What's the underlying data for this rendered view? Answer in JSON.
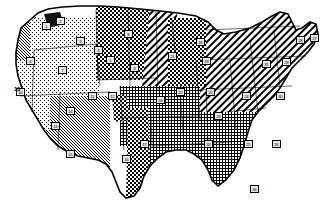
{
  "image": {
    "kind": "thematic-map",
    "subject": "Contiguous United States climate / region map",
    "style": "black-and-white halftone dithered print scan",
    "width": 332,
    "height": 215,
    "background_color": "#ffffff",
    "ink_color": "#000000"
  },
  "legend_patterns": [
    {
      "id": "stipple-light",
      "label": "light stipple",
      "description": "sparse dot stipple, very light tone"
    },
    {
      "id": "stipple-medium",
      "label": "medium stipple",
      "description": "medium dot stipple tone"
    },
    {
      "id": "grid-fine",
      "label": "fine crosshatch grid",
      "description": "fine square grid crosshatch"
    },
    {
      "id": "grid-heavy",
      "label": "heavy checkerboard",
      "description": "dense dark checkerboard blocks"
    },
    {
      "id": "diagonal-hatch",
      "label": "diagonal hatch",
      "description": "parallel diagonal lines"
    },
    {
      "id": "solid-dark",
      "label": "solid dark",
      "description": "near solid black fill"
    }
  ],
  "regions": [
    {
      "name": "pacific-northwest-coast",
      "pattern": "stipple-medium"
    },
    {
      "name": "great-basin-interior-west",
      "pattern": "stipple-light"
    },
    {
      "name": "northern-rockies-plains",
      "pattern": "grid-heavy"
    },
    {
      "name": "upper-midwest-hatch-band",
      "pattern": "diagonal-hatch"
    },
    {
      "name": "great-lakes",
      "pattern": "grid-heavy"
    },
    {
      "name": "northeast-new-england",
      "pattern": "diagonal-hatch"
    },
    {
      "name": "southeast-atlantic-gulf",
      "pattern": "grid-fine"
    },
    {
      "name": "texas-gulf-band",
      "pattern": "grid-heavy"
    },
    {
      "name": "southwest-desert",
      "pattern": "stipple-medium"
    },
    {
      "name": "california-central-valley",
      "pattern": "stipple-light"
    }
  ],
  "markers": [
    {
      "id": "m01",
      "label": "1",
      "x": 42,
      "y": 22
    },
    {
      "id": "m02",
      "label": "2",
      "x": 56,
      "y": 17
    },
    {
      "id": "m03",
      "label": "3",
      "x": 76,
      "y": 37
    },
    {
      "id": "m04",
      "label": "4",
      "x": 94,
      "y": 46
    },
    {
      "id": "m05",
      "label": "5",
      "x": 106,
      "y": 56
    },
    {
      "id": "m06",
      "label": "6",
      "x": 26,
      "y": 57
    },
    {
      "id": "m07",
      "label": "7",
      "x": 58,
      "y": 66
    },
    {
      "id": "m08",
      "label": "8",
      "x": 124,
      "y": 30
    },
    {
      "id": "m09",
      "label": "9",
      "x": 130,
      "y": 64
    },
    {
      "id": "m10",
      "label": "10",
      "x": 16,
      "y": 88
    },
    {
      "id": "m11",
      "label": "11",
      "x": 88,
      "y": 92
    },
    {
      "id": "m12",
      "label": "12",
      "x": 108,
      "y": 92
    },
    {
      "id": "m13",
      "label": "13",
      "x": 51,
      "y": 122
    },
    {
      "id": "m14",
      "label": "14",
      "x": 66,
      "y": 107
    },
    {
      "id": "m15",
      "label": "15",
      "x": 66,
      "y": 150
    },
    {
      "id": "m16",
      "label": "16",
      "x": 122,
      "y": 155
    },
    {
      "id": "m17",
      "label": "17",
      "x": 140,
      "y": 140
    },
    {
      "id": "m18",
      "label": "18",
      "x": 196,
      "y": 38
    },
    {
      "id": "m19",
      "label": "19",
      "x": 202,
      "y": 57
    },
    {
      "id": "m20",
      "label": "20",
      "x": 206,
      "y": 88
    },
    {
      "id": "m21",
      "label": "21",
      "x": 168,
      "y": 52
    },
    {
      "id": "m22",
      "label": "22",
      "x": 176,
      "y": 88
    },
    {
      "id": "m23",
      "label": "23",
      "x": 214,
      "y": 112
    },
    {
      "id": "m24",
      "label": "24",
      "x": 242,
      "y": 92
    },
    {
      "id": "m25",
      "label": "25",
      "x": 244,
      "y": 140
    },
    {
      "id": "m26",
      "label": "26",
      "x": 272,
      "y": 140
    },
    {
      "id": "m27",
      "label": "27",
      "x": 310,
      "y": 34
    },
    {
      "id": "m28",
      "label": "28",
      "x": 296,
      "y": 36
    },
    {
      "id": "m29",
      "label": "29",
      "x": 282,
      "y": 58
    },
    {
      "id": "m30",
      "label": "30",
      "x": 276,
      "y": 92
    },
    {
      "id": "m31",
      "label": "31",
      "x": 262,
      "y": 60
    },
    {
      "id": "m32",
      "label": "32",
      "x": 204,
      "y": 140
    },
    {
      "id": "m33",
      "label": "33",
      "x": 156,
      "y": 96
    },
    {
      "id": "m34",
      "label": "34",
      "x": 250,
      "y": 185
    }
  ],
  "free_labels": [
    {
      "id": "t10",
      "text": "10",
      "x": 14,
      "y": 86
    }
  ]
}
